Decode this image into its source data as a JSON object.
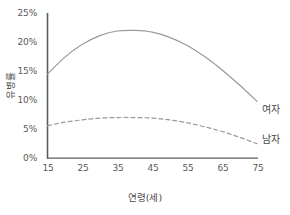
{
  "chart_data": {
    "type": "line",
    "title": "",
    "xlabel": "연령(세)",
    "ylabel": "유병률",
    "xlim": [
      15,
      75
    ],
    "ylim": [
      0,
      25
    ],
    "grid": false,
    "legend_position": "right-of-line-ends",
    "x_ticks": [
      "15",
      "25",
      "35",
      "45",
      "55",
      "65",
      "75"
    ],
    "y_ticks": [
      "0%",
      "5%",
      "10%",
      "15%",
      "20%",
      "25%"
    ],
    "x": [
      15,
      20,
      25,
      30,
      35,
      40,
      45,
      50,
      55,
      60,
      65,
      70,
      75
    ],
    "series": [
      {
        "name": "여자",
        "style": "solid",
        "color": "#9a9a9a",
        "values": [
          14.5,
          17.4,
          19.6,
          21.1,
          21.9,
          22.0,
          21.7,
          20.8,
          19.4,
          17.5,
          15.2,
          12.6,
          9.8
        ]
      },
      {
        "name": "남자",
        "style": "dashed",
        "color": "#9a9a9a",
        "values": [
          5.6,
          6.2,
          6.6,
          6.9,
          7.0,
          7.0,
          6.9,
          6.6,
          6.1,
          5.4,
          4.6,
          3.6,
          2.5
        ]
      }
    ],
    "axis_color": "#5c5c5c",
    "background": "#ffffff"
  },
  "legend": {
    "female_label": "여자",
    "male_label": "남자"
  },
  "axes": {
    "x_title": "연령(세)",
    "y_title": "유병률"
  }
}
